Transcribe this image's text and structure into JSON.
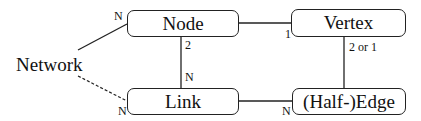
{
  "diagram": {
    "entities": {
      "network": "Network",
      "node": "Node",
      "vertex": "Vertex",
      "link": "Link",
      "edge": "(Half-)Edge"
    },
    "relations": [
      {
        "from": "Network",
        "to": "Node",
        "style": "solid",
        "cardinality_to": "N"
      },
      {
        "from": "Network",
        "to": "Link",
        "style": "dashed",
        "cardinality_to": "N"
      },
      {
        "from": "Node",
        "to": "Vertex",
        "style": "solid",
        "cardinality_to": "1"
      },
      {
        "from": "Node",
        "to": "Link",
        "style": "solid",
        "cardinality_from": "2",
        "cardinality_to": "N"
      },
      {
        "from": "Vertex",
        "to": "(Half-)Edge",
        "style": "solid",
        "cardinality_from": "2 or 1"
      },
      {
        "from": "Link",
        "to": "(Half-)Edge",
        "style": "solid",
        "cardinality_to": "N"
      }
    ],
    "labels": {
      "network_node_n": "N",
      "network_link_n": "N",
      "node_vertex_1": "1",
      "node_link_2": "2",
      "node_link_n": "N",
      "vertex_edge": "2 or 1",
      "link_edge_n": "N"
    },
    "colors": {
      "line": "#222222",
      "background": "#ffffff"
    }
  }
}
